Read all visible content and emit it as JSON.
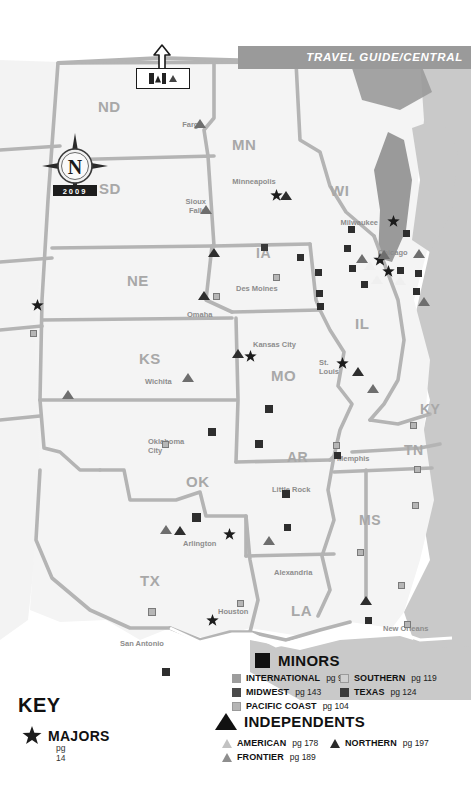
{
  "header": {
    "banner_text": "TRAVEL GUIDE/CENTRAL",
    "banner_color": "#9a9a9a"
  },
  "compass": {
    "north_letter": "N",
    "year": "2009"
  },
  "border_callout": {
    "icon_flag": "canada-flag-icon",
    "icon_triangle": "triangle-marker-icon",
    "arrow": "arrow-up-icon"
  },
  "states": [
    {
      "abbr": "ND",
      "x": 98,
      "y": 98,
      "size": 15
    },
    {
      "abbr": "MN",
      "x": 232,
      "y": 136,
      "size": 15
    },
    {
      "abbr": "SD",
      "x": 99,
      "y": 180,
      "size": 15
    },
    {
      "abbr": "WI",
      "x": 330,
      "y": 182,
      "size": 15
    },
    {
      "abbr": "IA",
      "x": 256,
      "y": 245,
      "size": 14
    },
    {
      "abbr": "NE",
      "x": 127,
      "y": 272,
      "size": 15
    },
    {
      "abbr": "IL",
      "x": 355,
      "y": 315,
      "size": 15
    },
    {
      "abbr": "KS",
      "x": 139,
      "y": 350,
      "size": 15
    },
    {
      "abbr": "MO",
      "x": 271,
      "y": 367,
      "size": 15
    },
    {
      "abbr": "KY",
      "x": 420,
      "y": 401,
      "size": 14
    },
    {
      "abbr": "AR",
      "x": 287,
      "y": 449,
      "size": 14
    },
    {
      "abbr": "TN",
      "x": 404,
      "y": 442,
      "size": 14
    },
    {
      "abbr": "OK",
      "x": 186,
      "y": 473,
      "size": 15
    },
    {
      "abbr": "MS",
      "x": 359,
      "y": 512,
      "size": 14
    },
    {
      "abbr": "TX",
      "x": 140,
      "y": 572,
      "size": 15
    },
    {
      "abbr": "LA",
      "x": 291,
      "y": 602,
      "size": 15
    }
  ],
  "cities": [
    {
      "name": "Fargo",
      "x": 169,
      "y": 121,
      "align": "right",
      "w": 34
    },
    {
      "name": "Minneapolis",
      "x": 226,
      "y": 178,
      "align": "center",
      "w": 56
    },
    {
      "name": "Sioux\nFalls",
      "x": 176,
      "y": 198,
      "align": "right",
      "w": 30
    },
    {
      "name": "Milwaukee",
      "x": 332,
      "y": 219,
      "align": "right",
      "w": 46
    },
    {
      "name": "Chicago",
      "x": 378,
      "y": 249,
      "align": "left",
      "w": 42
    },
    {
      "name": "Des Moines",
      "x": 236,
      "y": 285,
      "align": "left",
      "w": 52
    },
    {
      "name": "Omaha",
      "x": 187,
      "y": 311,
      "align": "left",
      "w": 32
    },
    {
      "name": "Kansas City",
      "x": 253,
      "y": 341,
      "align": "left",
      "w": 54
    },
    {
      "name": "St.\nLouis",
      "x": 319,
      "y": 359,
      "align": "left",
      "w": 22
    },
    {
      "name": "Wichita",
      "x": 145,
      "y": 378,
      "align": "left",
      "w": 34
    },
    {
      "name": "Oklahoma\nCity",
      "x": 148,
      "y": 438,
      "align": "left",
      "w": 44
    },
    {
      "name": "Memphis",
      "x": 337,
      "y": 455,
      "align": "left",
      "w": 38
    },
    {
      "name": "Little Rock",
      "x": 272,
      "y": 486,
      "align": "left",
      "w": 48
    },
    {
      "name": "Arlington",
      "x": 183,
      "y": 540,
      "align": "left",
      "w": 44
    },
    {
      "name": "Alexandria",
      "x": 274,
      "y": 569,
      "align": "left",
      "w": 48
    },
    {
      "name": "Houston",
      "x": 218,
      "y": 608,
      "align": "left",
      "w": 40
    },
    {
      "name": "San Antonio",
      "x": 120,
      "y": 640,
      "align": "left",
      "w": 54
    },
    {
      "name": "New Orleans",
      "x": 383,
      "y": 625,
      "align": "left",
      "w": 54
    }
  ],
  "markers": {
    "stars": [
      {
        "x": 276,
        "y": 195,
        "s": 13
      },
      {
        "x": 393,
        "y": 221,
        "s": 13
      },
      {
        "x": 380,
        "y": 260,
        "s": 14
      },
      {
        "x": 388,
        "y": 271,
        "s": 13
      },
      {
        "x": 250,
        "y": 356,
        "s": 13
      },
      {
        "x": 342,
        "y": 363,
        "s": 13
      },
      {
        "x": 229,
        "y": 534,
        "s": 13
      },
      {
        "x": 37,
        "y": 305,
        "s": 13
      },
      {
        "x": 212,
        "y": 620,
        "s": 13
      }
    ],
    "squares": [
      {
        "x": 264,
        "y": 247,
        "s": 7,
        "c": "#3a3a3a"
      },
      {
        "x": 300,
        "y": 257,
        "s": 7,
        "c": "#2e2e2e"
      },
      {
        "x": 318,
        "y": 272,
        "s": 7,
        "c": "#2e2e2e"
      },
      {
        "x": 351,
        "y": 229,
        "s": 7,
        "c": "#2e2e2e"
      },
      {
        "x": 347,
        "y": 248,
        "s": 7,
        "c": "#2e2e2e"
      },
      {
        "x": 364,
        "y": 284,
        "s": 7,
        "c": "#2e2e2e"
      },
      {
        "x": 319,
        "y": 293,
        "s": 7,
        "c": "#2e2e2e"
      },
      {
        "x": 320,
        "y": 306,
        "s": 7,
        "c": "#2e2e2e"
      },
      {
        "x": 406,
        "y": 233,
        "s": 7,
        "c": "#2e2e2e"
      },
      {
        "x": 418,
        "y": 273,
        "s": 7,
        "c": "#2e2e2e"
      },
      {
        "x": 416,
        "y": 291,
        "s": 7,
        "c": "#2e2e2e"
      },
      {
        "x": 400,
        "y": 270,
        "s": 7,
        "c": "#2e2e2e"
      },
      {
        "x": 352,
        "y": 268,
        "s": 7,
        "c": "#2e2e2e"
      },
      {
        "x": 276,
        "y": 277,
        "s": 7,
        "c": "#8d8d8d"
      },
      {
        "x": 216,
        "y": 296,
        "s": 7,
        "c": "#8d8d8d"
      },
      {
        "x": 33,
        "y": 333,
        "s": 7,
        "c": "#8d8d8d"
      },
      {
        "x": 269,
        "y": 409,
        "s": 8,
        "c": "#2e2e2e"
      },
      {
        "x": 259,
        "y": 444,
        "s": 8,
        "c": "#2e2e2e"
      },
      {
        "x": 212,
        "y": 432,
        "s": 8,
        "c": "#2e2e2e"
      },
      {
        "x": 286,
        "y": 494,
        "s": 8,
        "c": "#2e2e2e"
      },
      {
        "x": 165,
        "y": 444,
        "s": 7,
        "c": "#8d8d8d"
      },
      {
        "x": 336,
        "y": 445,
        "s": 7,
        "c": "#8d8d8d"
      },
      {
        "x": 337,
        "y": 455,
        "s": 7,
        "c": "#2e2e2e"
      },
      {
        "x": 413,
        "y": 425,
        "s": 7,
        "c": "#8d8d8d"
      },
      {
        "x": 417,
        "y": 469,
        "s": 7,
        "c": "#8d8d8d"
      },
      {
        "x": 415,
        "y": 505,
        "s": 7,
        "c": "#8d8d8d"
      },
      {
        "x": 360,
        "y": 552,
        "s": 7,
        "c": "#8d8d8d"
      },
      {
        "x": 401,
        "y": 585,
        "s": 7,
        "c": "#8d8d8d"
      },
      {
        "x": 407,
        "y": 624,
        "s": 7,
        "c": "#8d8d8d"
      },
      {
        "x": 368,
        "y": 620,
        "s": 7,
        "c": "#2e2e2e"
      },
      {
        "x": 287,
        "y": 527,
        "s": 7,
        "c": "#2e2e2e"
      },
      {
        "x": 196,
        "y": 517,
        "s": 9,
        "c": "#2e2e2e"
      },
      {
        "x": 152,
        "y": 612,
        "s": 8,
        "c": "#8d8d8d"
      },
      {
        "x": 166,
        "y": 672,
        "s": 8,
        "c": "#2e2e2e"
      },
      {
        "x": 240,
        "y": 603,
        "s": 7,
        "c": "#8d8d8d"
      }
    ],
    "triangles": [
      {
        "x": 200,
        "y": 124,
        "s": 6,
        "c": "#6e6e6e"
      },
      {
        "x": 206,
        "y": 210,
        "s": 6,
        "c": "#6e6e6e"
      },
      {
        "x": 286,
        "y": 196,
        "s": 6,
        "c": "#2e2e2e"
      },
      {
        "x": 214,
        "y": 253,
        "s": 6,
        "c": "#2e2e2e"
      },
      {
        "x": 204,
        "y": 296,
        "s": 6,
        "c": "#2e2e2e"
      },
      {
        "x": 362,
        "y": 259,
        "s": 6,
        "c": "#6e6e6e"
      },
      {
        "x": 370,
        "y": 266,
        "s": 6,
        "c": "#ffffff"
      },
      {
        "x": 377,
        "y": 280,
        "s": 6,
        "c": "#ffffff"
      },
      {
        "x": 384,
        "y": 255,
        "s": 6,
        "c": "#6e6e6e"
      },
      {
        "x": 400,
        "y": 281,
        "s": 6,
        "c": "#ffffff"
      },
      {
        "x": 419,
        "y": 254,
        "s": 6,
        "c": "#6e6e6e"
      },
      {
        "x": 424,
        "y": 302,
        "s": 6,
        "c": "#6e6e6e"
      },
      {
        "x": 238,
        "y": 354,
        "s": 6,
        "c": "#2e2e2e"
      },
      {
        "x": 358,
        "y": 372,
        "s": 6,
        "c": "#2e2e2e"
      },
      {
        "x": 188,
        "y": 378,
        "s": 6,
        "c": "#6e6e6e"
      },
      {
        "x": 373,
        "y": 389,
        "s": 6,
        "c": "#6e6e6e"
      },
      {
        "x": 68,
        "y": 395,
        "s": 6,
        "c": "#6e6e6e"
      },
      {
        "x": 166,
        "y": 530,
        "s": 6,
        "c": "#6e6e6e"
      },
      {
        "x": 180,
        "y": 531,
        "s": 6,
        "c": "#2e2e2e"
      },
      {
        "x": 269,
        "y": 541,
        "s": 6,
        "c": "#6e6e6e"
      },
      {
        "x": 366,
        "y": 601,
        "s": 6,
        "c": "#2e2e2e"
      }
    ]
  },
  "legend": {
    "key_title": "KEY",
    "majors": {
      "label": "MAJORS",
      "page": "pg 14",
      "icon": "star-icon"
    },
    "minors": {
      "title": "MINORS",
      "icon": "square-icon",
      "items": [
        {
          "label": "INTERNATIONAL",
          "page": "pg 96",
          "color": "#9d9d9d",
          "col": 0,
          "row": 0
        },
        {
          "label": "MIDWEST",
          "page": "pg 143",
          "color": "#4a4a4a",
          "col": 0,
          "row": 1
        },
        {
          "label": "PACIFIC COAST",
          "page": "pg 104",
          "color": "#b5b5b5",
          "col": 0,
          "row": 2
        },
        {
          "label": "SOUTHERN",
          "page": "pg 119",
          "color": "#d0d0d0",
          "col": 1,
          "row": 0
        },
        {
          "label": "TEXAS",
          "page": "pg 124",
          "color": "#3a3a3a",
          "col": 1,
          "row": 1
        }
      ]
    },
    "independents": {
      "title": "INDEPENDENTS",
      "icon": "triangle-icon",
      "items": [
        {
          "label": "AMERICAN",
          "page": "pg 178",
          "color": "#c2c2c2",
          "col": 0,
          "row": 0
        },
        {
          "label": "NORTHERN",
          "page": "pg 197",
          "color": "#2a2a2a",
          "col": 1,
          "row": 0
        },
        {
          "label": "FRONTIER",
          "page": "pg 189",
          "color": "#8e8e8e",
          "col": 0,
          "row": 1
        }
      ]
    }
  },
  "colors": {
    "land": "#f4f4f4",
    "land_shade": "#e8e8e8",
    "outside": "#c9c9c9",
    "water": "#9a9a9a",
    "border_line": "#b4b4b4",
    "state_label": "#a8a8a8",
    "city_label": "#8d8d8d"
  }
}
